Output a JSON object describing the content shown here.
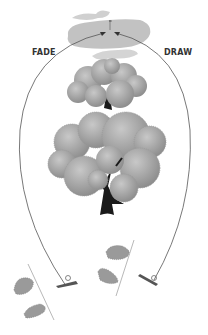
{
  "labels": {
    "left": "FADE",
    "right": "DRAW"
  },
  "colors": {
    "foliage": "#a9a9a9",
    "foliage_dark": "#8f8f8f",
    "green": "#c4c4c4",
    "trunk": "#1a1a1a",
    "path": "#555555",
    "footprint": "#9a9a9a"
  },
  "elements": {
    "green": "putting-green",
    "flag": "pin-flag",
    "tree_small": "small-tree",
    "tree_large": "large-tree",
    "left_golfer": "fade-stance",
    "right_golfer": "draw-stance"
  }
}
